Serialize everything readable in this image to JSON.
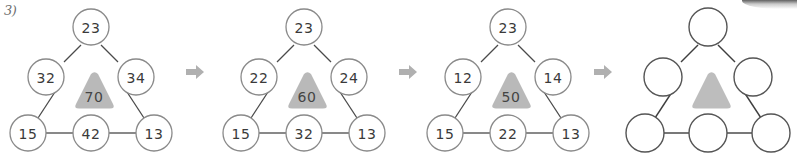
{
  "page": {
    "exercise_label": "3)",
    "background_color": "#ffffff"
  },
  "style": {
    "node_stroke": "#8a8a8a",
    "node_fill": "#ffffff",
    "node_text_color": "#3a3a3a",
    "edge_color": "#4a4a4a",
    "triangle_fill": "#b9b9b9",
    "triangle_text_color": "#444444",
    "arrow_color": "#b0b0b0",
    "empty_node_stroke": "#555555"
  },
  "arrows": [
    {
      "name": "arrow-1",
      "glyph": "➡"
    },
    {
      "name": "arrow-2",
      "glyph": "➡"
    },
    {
      "name": "arrow-3",
      "glyph": "➡"
    }
  ],
  "panels": [
    {
      "index": 1,
      "name": "triangle-puzzle-step-1",
      "center_value": "70",
      "nodes": {
        "top": "23",
        "left_mid": "32",
        "right_mid": "34",
        "bottom_left": "15",
        "bottom_mid": "42",
        "bottom_right": "13"
      }
    },
    {
      "index": 2,
      "name": "triangle-puzzle-step-2",
      "center_value": "60",
      "nodes": {
        "top": "23",
        "left_mid": "22",
        "right_mid": "24",
        "bottom_left": "15",
        "bottom_mid": "32",
        "bottom_right": "13"
      }
    },
    {
      "index": 3,
      "name": "triangle-puzzle-step-3",
      "center_value": "50",
      "nodes": {
        "top": "23",
        "left_mid": "12",
        "right_mid": "14",
        "bottom_left": "15",
        "bottom_mid": "22",
        "bottom_right": "13"
      }
    },
    {
      "index": 4,
      "name": "triangle-puzzle-step-4-blank",
      "center_value": "",
      "nodes": {
        "top": "",
        "left_mid": "",
        "right_mid": "",
        "bottom_left": "",
        "bottom_mid": "",
        "bottom_right": ""
      }
    }
  ]
}
